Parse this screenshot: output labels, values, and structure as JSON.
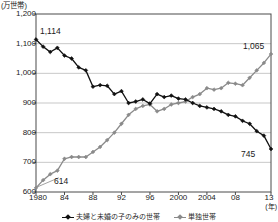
{
  "chart_data": {
    "type": "line",
    "title": "",
    "ylabel": "(万世帯)",
    "xlabel": "(年)",
    "ylim": [
      600,
      1200
    ],
    "ytick_labels": [
      "1,200",
      "1,100",
      "1,000",
      "900",
      "800",
      "700",
      "600"
    ],
    "ytick_values": [
      1200,
      1100,
      1000,
      900,
      800,
      700,
      600
    ],
    "xlim": [
      1980,
      2013
    ],
    "xtick_labels": [
      "1980",
      "84",
      "88",
      "92",
      "96",
      "2000",
      "2004",
      "08",
      "13"
    ],
    "xtick_values": [
      1980,
      1984,
      1988,
      1992,
      1996,
      2000,
      2004,
      2008,
      2013
    ],
    "grid": "horizontal",
    "legend_position": "bottom",
    "x": [
      1980,
      1981,
      1982,
      1983,
      1984,
      1985,
      1986,
      1987,
      1988,
      1989,
      1990,
      1991,
      1992,
      1993,
      1994,
      1995,
      1996,
      1997,
      1998,
      1999,
      2000,
      2001,
      2002,
      2003,
      2004,
      2005,
      2006,
      2007,
      2008,
      2009,
      2010,
      2011,
      2012,
      2013
    ],
    "series": [
      {
        "name": "夫婦と未婚の子のみの世帯",
        "color": "#111111",
        "marker": "diamond",
        "values": [
          1114,
          1090,
          1072,
          1086,
          1060,
          1050,
          1020,
          1010,
          955,
          960,
          958,
          930,
          940,
          900,
          905,
          912,
          898,
          930,
          920,
          925,
          915,
          912,
          900,
          890,
          885,
          880,
          872,
          860,
          855,
          840,
          830,
          805,
          790,
          745
        ]
      },
      {
        "name": "単独世帯",
        "color": "#8a8a8a",
        "marker": "diamond",
        "values": [
          614,
          640,
          660,
          672,
          712,
          718,
          718,
          718,
          735,
          752,
          775,
          800,
          830,
          860,
          880,
          890,
          895,
          872,
          880,
          895,
          900,
          905,
          920,
          930,
          950,
          945,
          950,
          968,
          965,
          960,
          985,
          1010,
          1035,
          1065
        ]
      }
    ],
    "annotations": [
      {
        "label": "1,114",
        "x": 1980,
        "y": 1114,
        "series": "夫婦と未婚の子のみの世帯"
      },
      {
        "label": "614",
        "x": 1980,
        "y": 614,
        "series": "単独世帯",
        "leader": true
      },
      {
        "label": "1,065",
        "x": 2013,
        "y": 1065,
        "series": "単独世帯"
      },
      {
        "label": "745",
        "x": 2013,
        "y": 745,
        "series": "夫婦と未婚の子のみの世帯"
      }
    ]
  },
  "legend": {
    "items": [
      {
        "label": "夫婦と未婚の子のみの世帯",
        "color": "#111111"
      },
      {
        "label": "単独世帯",
        "color": "#8a8a8a"
      }
    ]
  }
}
